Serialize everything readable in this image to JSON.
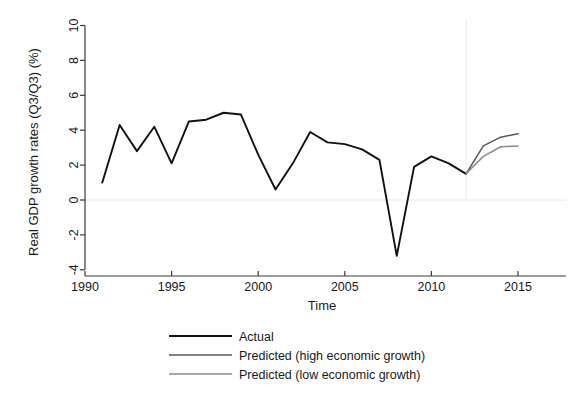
{
  "chart_data": {
    "type": "line",
    "title": "",
    "xlabel": "Time",
    "ylabel": "Real GDP growth rates (Q3/Q3) (%)",
    "xlim": [
      1990,
      2015.5
    ],
    "ylim": [
      -4.6,
      10.6
    ],
    "xticks": [
      1990,
      1995,
      2000,
      2005,
      2010,
      2015
    ],
    "xtick_labels": [
      "1990",
      "1995",
      "2000",
      "2005",
      "2010",
      "2015"
    ],
    "yticks": [
      -4,
      -2,
      0,
      2,
      4,
      6,
      8,
      10
    ],
    "ytick_labels": [
      "-4",
      "-2",
      "0",
      "2",
      "4",
      "6",
      "8",
      "10"
    ],
    "grid": "faint zero line and faint vertical line at 2012",
    "zero_line_y": 0,
    "forecast_divider_x": 2012,
    "legend_position": "below-axes",
    "series": [
      {
        "name": "Actual",
        "color": "#111111",
        "x": [
          1991,
          1992,
          1993,
          1994,
          1995,
          1996,
          1997,
          1998,
          1999,
          2000,
          2001,
          2002,
          2003,
          2004,
          2005,
          2006,
          2007,
          2008,
          2009,
          2010,
          2011,
          2012
        ],
        "values": [
          1.0,
          4.3,
          2.8,
          4.2,
          2.1,
          4.5,
          4.6,
          5.0,
          4.9,
          2.6,
          0.6,
          2.1,
          3.9,
          3.3,
          3.2,
          2.9,
          2.3,
          -3.2,
          1.9,
          2.5,
          2.1,
          1.5
        ]
      },
      {
        "name": "Predicted (high economic growth)",
        "color": "#585858",
        "x": [
          2012,
          2013,
          2014,
          2015
        ],
        "values": [
          1.5,
          3.1,
          3.6,
          3.8
        ]
      },
      {
        "name": "Predicted (low economic growth)",
        "color": "#8a8a8a",
        "x": [
          2012,
          2013,
          2014,
          2015
        ],
        "values": [
          1.5,
          2.5,
          3.05,
          3.1
        ]
      }
    ]
  },
  "legend": {
    "items": [
      {
        "label": "Actual"
      },
      {
        "label": "Predicted (high economic growth)"
      },
      {
        "label": "Predicted (low economic growth)"
      }
    ]
  },
  "axes": {
    "x_label": "Time",
    "y_label": "Real GDP growth rates (Q3/Q3) (%)"
  }
}
